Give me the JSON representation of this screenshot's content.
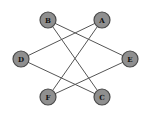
{
  "diagram": {
    "type": "graph",
    "nodes": [
      {
        "id": "A",
        "label": "A",
        "x": 102,
        "y": 20
      },
      {
        "id": "B",
        "label": "B",
        "x": 48,
        "y": 20
      },
      {
        "id": "C",
        "label": "C",
        "x": 102,
        "y": 97
      },
      {
        "id": "D",
        "label": "D",
        "x": 21,
        "y": 59
      },
      {
        "id": "E",
        "label": "E",
        "x": 130,
        "y": 59
      },
      {
        "id": "F",
        "label": "F",
        "x": 48,
        "y": 97
      }
    ],
    "edges": [
      {
        "from": "B",
        "to": "E"
      },
      {
        "from": "B",
        "to": "C"
      },
      {
        "from": "A",
        "to": "D"
      },
      {
        "from": "A",
        "to": "F"
      },
      {
        "from": "D",
        "to": "C"
      },
      {
        "from": "E",
        "to": "F"
      }
    ],
    "colors": {
      "node_fill": "#8f8f8f",
      "node_stroke": "#4a4a4a",
      "edge": "#555555"
    }
  }
}
